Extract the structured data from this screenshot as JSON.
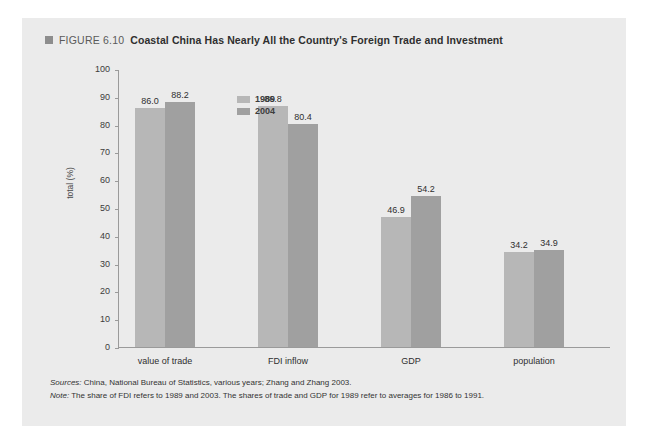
{
  "figure": {
    "label": "FIGURE 6.10",
    "heading": "Coastal China Has Nearly All the Country's Foreign Trade and Investment",
    "bullet_color": "#8d8d8d"
  },
  "footnotes": {
    "sources_label": "Sources:",
    "sources_text": " China, National Bureau of Statistics, various years; Zhang and Zhang 2003.",
    "note_label": "Note:",
    "note_text": " The share of FDI refers to 1989 and 2003. The shares of trade and GDP for 1989 refer to averages for 1986 to 1991."
  },
  "chart_data": {
    "type": "bar",
    "title": "Coastal China Has Nearly All the Country's Foreign Trade and Investment",
    "xlabel": "",
    "ylabel": "total (%)",
    "ylim": [
      0,
      100
    ],
    "ytick_step": 10,
    "yticks": [
      "0",
      "10",
      "20",
      "30",
      "40",
      "50",
      "60",
      "70",
      "80",
      "90",
      "100"
    ],
    "grid": false,
    "legend_position": "top-left-inside",
    "categories": [
      "value of trade",
      "FDI inflow",
      "GDP",
      "population"
    ],
    "series": [
      {
        "name": "1989",
        "color": "#b7b7b7",
        "values": [
          86.0,
          86.8,
          46.9,
          34.2
        ],
        "labels": [
          "86.0",
          "86.8",
          "46.9",
          "34.2"
        ]
      },
      {
        "name": "2004",
        "color": "#a0a0a0",
        "values": [
          88.2,
          80.4,
          54.2,
          34.9
        ],
        "labels": [
          "88.2",
          "80.4",
          "54.2",
          "34.9"
        ]
      }
    ]
  }
}
